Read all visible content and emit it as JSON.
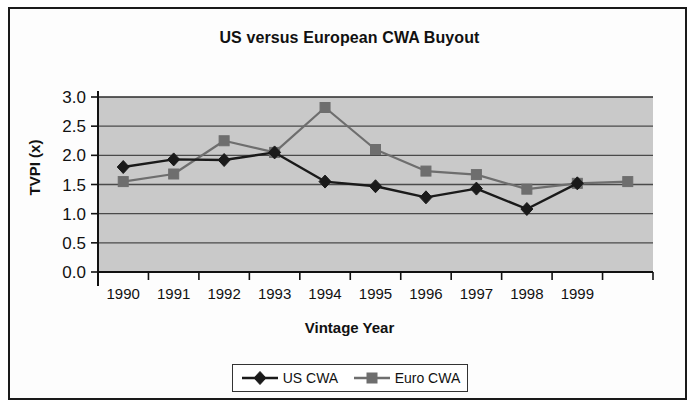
{
  "chart_data": {
    "type": "line",
    "title": "US versus European CWA Buyout",
    "xlabel": "Vintage Year",
    "ylabel": "TVPI (x)",
    "categories": [
      "1990",
      "1991",
      "1992",
      "1993",
      "1994",
      "1995",
      "1996",
      "1997",
      "1998",
      "1999",
      ""
    ],
    "ytick_labels": [
      "3.0",
      "2.5",
      "2.0",
      "1.5",
      "1.0",
      "0.5",
      "0.0"
    ],
    "ylim": [
      0.0,
      3.0
    ],
    "ytick_step": 0.5,
    "grid": "horizontal",
    "legend_position": "bottom",
    "plot_background": "#c9c9c9",
    "series": [
      {
        "name": "US CWA",
        "color": "#1a1a1a",
        "marker": "diamond",
        "values": [
          1.8,
          1.93,
          1.92,
          2.05,
          1.55,
          1.47,
          1.28,
          1.43,
          1.08,
          1.52,
          null
        ]
      },
      {
        "name": "Euro CWA",
        "color": "#6e6e6e",
        "marker": "square",
        "values": [
          1.55,
          1.68,
          2.25,
          2.05,
          2.82,
          2.1,
          1.73,
          1.67,
          1.42,
          1.52,
          1.55
        ]
      }
    ]
  },
  "legend": {
    "items": [
      {
        "label": "US CWA",
        "color": "#1a1a1a",
        "marker": "diamond"
      },
      {
        "label": "Euro CWA",
        "color": "#6e6e6e",
        "marker": "square"
      }
    ]
  }
}
